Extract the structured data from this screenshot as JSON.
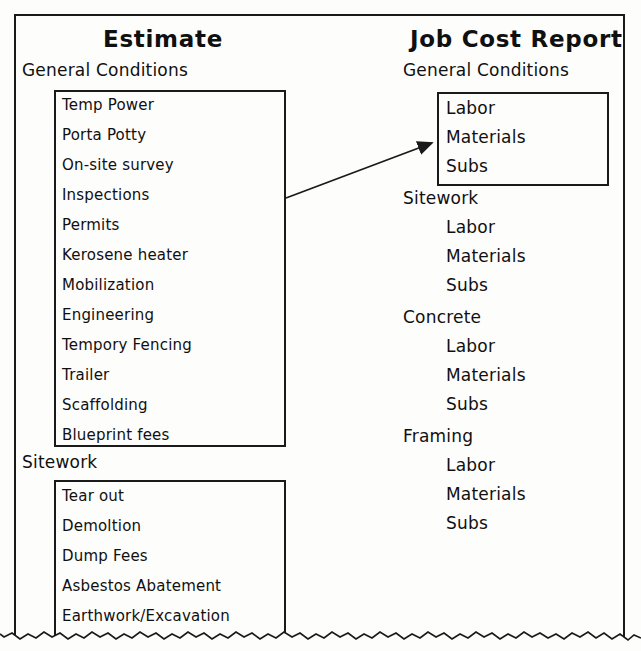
{
  "diagram": {
    "left_column": {
      "title": "Estimate",
      "groups": [
        {
          "label": "General Conditions",
          "boxed": true,
          "items": [
            "Temp Power",
            "Porta Potty",
            "On-site survey",
            "Inspections",
            "Permits",
            "Kerosene heater",
            "Mobilization",
            "Engineering",
            "Tempory Fencing",
            "Trailer",
            "Scaffolding",
            "Blueprint fees"
          ]
        },
        {
          "label": "Sitework",
          "boxed": true,
          "items": [
            "Tear out",
            "Demoltion",
            "Dump Fees",
            "Asbestos Abatement",
            "Earthwork/Excavation"
          ]
        }
      ]
    },
    "right_column": {
      "title": "Job Cost Report",
      "groups": [
        {
          "label": "General Conditions",
          "boxed": true,
          "items": [
            "Labor",
            "Materials",
            "Subs"
          ]
        },
        {
          "label": "Sitework",
          "boxed": false,
          "items": [
            "Labor",
            "Materials",
            "Subs"
          ]
        },
        {
          "label": "Concrete",
          "boxed": false,
          "items": [
            "Labor",
            "Materials",
            "Subs"
          ]
        },
        {
          "label": "Framing",
          "boxed": false,
          "items": [
            "Labor",
            "Materials",
            "Subs"
          ]
        }
      ]
    },
    "connector": {
      "name": "mapping-arrow",
      "from": "estimate-general-conditions-box",
      "to": "jobcost-general-conditions-box"
    },
    "colors": {
      "ink": "#1a1a1a",
      "paper": "#fdfdfc"
    }
  }
}
